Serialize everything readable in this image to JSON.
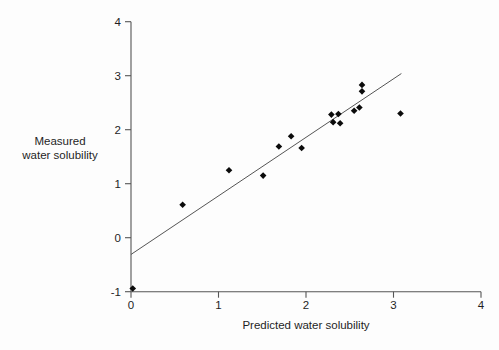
{
  "figure": {
    "background": "#fdfdfd",
    "text_color": "#1f1f1f",
    "axis_color": "#555555",
    "line_color": "#555555",
    "marker_color": "#0b0b0b"
  },
  "chart_data": {
    "type": "scatter",
    "title": "",
    "xlabel": "Predicted water solubility",
    "ylabel": "Measured\nwater solubility",
    "xlim": [
      0,
      4
    ],
    "ylim": [
      -1,
      4
    ],
    "x_ticks": [
      0,
      1,
      2,
      3,
      4
    ],
    "y_ticks": [
      4,
      3,
      2,
      1,
      0,
      -1
    ],
    "grid": false,
    "legend": null,
    "marker": "diamond",
    "points": [
      {
        "x": 0.02,
        "y": -0.94
      },
      {
        "x": 0.59,
        "y": 0.61
      },
      {
        "x": 1.12,
        "y": 1.25
      },
      {
        "x": 1.51,
        "y": 1.15
      },
      {
        "x": 1.69,
        "y": 1.69
      },
      {
        "x": 1.83,
        "y": 1.88
      },
      {
        "x": 1.95,
        "y": 1.66
      },
      {
        "x": 2.29,
        "y": 2.28
      },
      {
        "x": 2.31,
        "y": 2.14
      },
      {
        "x": 2.37,
        "y": 2.29
      },
      {
        "x": 2.39,
        "y": 2.12
      },
      {
        "x": 2.55,
        "y": 2.35
      },
      {
        "x": 2.61,
        "y": 2.41
      },
      {
        "x": 2.64,
        "y": 2.71
      },
      {
        "x": 2.64,
        "y": 2.83
      },
      {
        "x": 3.08,
        "y": 2.3
      }
    ],
    "trend_line": {
      "x1": 0,
      "y1": -0.31,
      "x2": 3.09,
      "y2": 3.04
    }
  }
}
